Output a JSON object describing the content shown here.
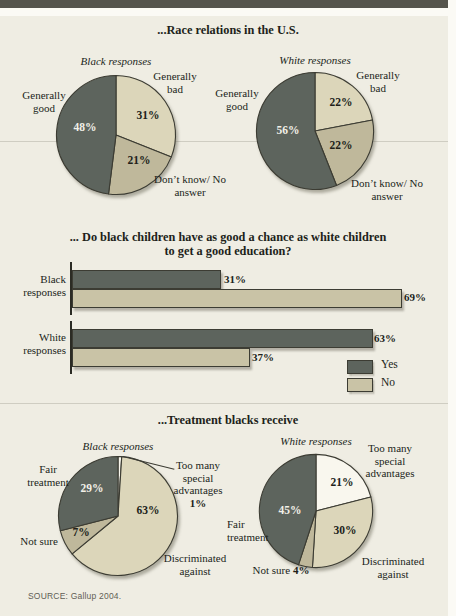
{
  "page": {
    "source": "SOURCE: Gallup 2004."
  },
  "colors": {
    "dark": "#5d645d",
    "light": "#dcd6ba",
    "medium": "#bfb89b",
    "white": "#f9f7ee",
    "light_bar": "#c9c3a6",
    "stroke": "#3c3c33",
    "background": "#efede3",
    "top_bar": "#55544c"
  },
  "chart_data": [
    {
      "type": "pie",
      "title": "...Race relations in the U.S.",
      "pies": [
        {
          "subtitle": "Black responses",
          "slices": [
            {
              "label": "Generally bad",
              "value": 31,
              "pct": "31%",
              "color": "light"
            },
            {
              "label": "Don’t know/ No answer",
              "value": 21,
              "pct": "21%",
              "color": "medium"
            },
            {
              "label": "Generally good",
              "value": 48,
              "pct": "48%",
              "color": "dark"
            }
          ]
        },
        {
          "subtitle": "White responses",
          "slices": [
            {
              "label": "Generally bad",
              "value": 22,
              "pct": "22%",
              "color": "light"
            },
            {
              "label": "Don’t know/ No answer",
              "value": 22,
              "pct": "22%",
              "color": "medium"
            },
            {
              "label": "Generally good",
              "value": 56,
              "pct": "56%",
              "color": "dark"
            }
          ]
        }
      ]
    },
    {
      "type": "bar",
      "title": "... Do black children have as good a chance as white children to get a good education?",
      "title_lines": [
        "... Do black children have as good a chance as white children",
        "to get a good education?"
      ],
      "categories": [
        "Black responses",
        "White responses"
      ],
      "series": [
        {
          "name": "Yes",
          "color": "dark",
          "values": [
            31,
            63
          ],
          "pcts": [
            "31%",
            "63%"
          ]
        },
        {
          "name": "No",
          "color": "light_bar",
          "values": [
            69,
            37
          ],
          "pcts": [
            "69%",
            "37%"
          ]
        }
      ],
      "xlim": [
        0,
        80
      ],
      "legend_position": "bottom-right"
    },
    {
      "type": "pie",
      "title": "...Treatment blacks receive",
      "pies": [
        {
          "subtitle": "Black responses",
          "slices": [
            {
              "label": "Too many special advantages",
              "value": 1,
              "pct": "1%",
              "color": "white"
            },
            {
              "label": "Discriminated against",
              "value": 63,
              "pct": "63%",
              "color": "light"
            },
            {
              "label": "Not sure",
              "value": 7,
              "pct": "7%",
              "color": "medium"
            },
            {
              "label": "Fair treatment",
              "value": 29,
              "pct": "29%",
              "color": "dark"
            }
          ]
        },
        {
          "subtitle": "White responses",
          "slices": [
            {
              "label": "Too many special advantages",
              "value": 21,
              "pct": "21%",
              "color": "white"
            },
            {
              "label": "Discriminated against",
              "value": 30,
              "pct": "30%",
              "color": "light"
            },
            {
              "label": "Not sure",
              "value": 4,
              "pct": "4%",
              "color": "medium"
            },
            {
              "label": "Fair treatment",
              "value": 45,
              "pct": "45%",
              "color": "dark"
            }
          ]
        }
      ]
    }
  ]
}
